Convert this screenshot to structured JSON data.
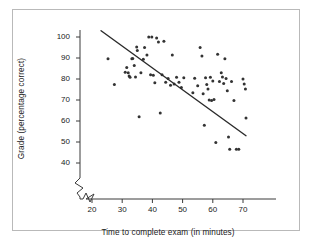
{
  "figure": {
    "title": "",
    "frame_color": "#b9b9b9",
    "background": "#ffffff",
    "point_color": "#333333",
    "line_color": "#2b2b2b"
  },
  "axes": {
    "x": {
      "label": "Time to complete exam (in minutes)",
      "ticks": [
        20,
        30,
        40,
        50,
        60,
        70
      ],
      "tick_labels": [
        "20",
        "30",
        "40",
        "50",
        "60",
        "70"
      ],
      "range": [
        15,
        75
      ],
      "has_break": true
    },
    "y": {
      "label": "Grade (percentage correct)",
      "ticks": [
        40,
        50,
        60,
        70,
        80,
        90,
        100
      ],
      "tick_labels": [
        "40",
        "50",
        "60",
        "70",
        "80",
        "90",
        "100"
      ],
      "range": [
        36,
        104
      ],
      "has_break": true
    }
  },
  "chart_data": {
    "type": "scatter",
    "title": "",
    "xlabel": "Time to complete exam (in minutes)",
    "ylabel": "Grade (percentage correct)",
    "xlim": [
      15,
      75
    ],
    "ylim": [
      36,
      104
    ],
    "grid": false,
    "legend": "none",
    "marker": "filled-circle",
    "x": [
      25.3,
      27.4,
      31.0,
      31.5,
      32.0,
      32.3,
      32.6,
      33.2,
      33.5,
      34.0,
      34.4,
      34.8,
      35.0,
      35.6,
      36.2,
      37.0,
      37.4,
      38.2,
      38.8,
      39.4,
      39.8,
      40.3,
      40.8,
      41.4,
      42.0,
      42.6,
      43.2,
      43.8,
      44.4,
      45.2,
      46.0,
      46.6,
      47.2,
      48.0,
      48.8,
      49.6,
      50.4,
      53.4,
      54.0,
      55.0,
      55.8,
      56.4,
      56.8,
      57.2,
      57.6,
      58.0,
      58.4,
      58.8,
      59.2,
      59.6,
      60.0,
      60.4,
      61.0,
      61.6,
      62.2,
      62.8,
      63.2,
      63.6,
      64.0,
      64.4,
      64.8,
      65.2,
      65.6,
      66.2,
      67.0,
      67.8,
      68.6,
      70.0,
      70.4,
      70.8,
      71.0
    ],
    "y": [
      89.6,
      77.4,
      83.2,
      85.5,
      83.0,
      81.4,
      80.8,
      89.6,
      89.8,
      86.4,
      81.0,
      95.2,
      93.6,
      62.0,
      83.0,
      89.4,
      95.0,
      91.4,
      100.0,
      82.0,
      100.0,
      81.8,
      78.2,
      99.5,
      97.6,
      63.8,
      82.0,
      98.0,
      78.4,
      80.2,
      77.0,
      91.4,
      77.6,
      80.8,
      78.4,
      76.0,
      80.6,
      73.4,
      80.4,
      76.8,
      95.0,
      91.0,
      73.0,
      58.0,
      80.6,
      77.4,
      75.2,
      70.0,
      80.8,
      69.8,
      79.0,
      70.2,
      49.8,
      91.8,
      78.8,
      83.0,
      81.0,
      77.8,
      89.6,
      80.2,
      74.4,
      52.4,
      46.6,
      78.8,
      69.8,
      46.6,
      46.6,
      80.0,
      77.6,
      75.2,
      61.4
    ],
    "trendline": {
      "type": "linear",
      "x_start": 23.0,
      "y_start": 103.0,
      "x_end": 71.0,
      "y_end": 53.0,
      "slope": -1.04,
      "intercept": 126.9
    },
    "n_points": 71,
    "relationship": "negative correlation"
  }
}
